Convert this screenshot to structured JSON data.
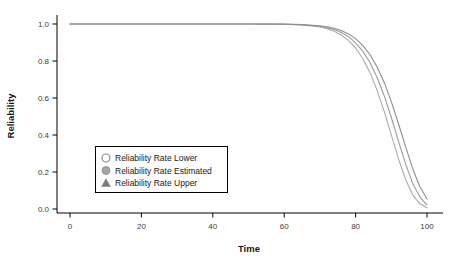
{
  "figure": {
    "background": "#ffffff"
  },
  "chart_data": {
    "type": "line",
    "title": "",
    "xlabel": "Time",
    "ylabel": "Reliability",
    "xlim": [
      0,
      100
    ],
    "ylim": [
      0.0,
      1.0
    ],
    "xticks": [
      "0",
      "20",
      "40",
      "60",
      "80",
      "100"
    ],
    "yticks": [
      "0.0",
      "0.2",
      "0.4",
      "0.6",
      "0.8",
      "1.0"
    ],
    "grid": false,
    "legend_position": "lower-left",
    "x": [
      0,
      10,
      20,
      30,
      40,
      50,
      55,
      60,
      65,
      70,
      72,
      74,
      76,
      78,
      80,
      82,
      84,
      86,
      88,
      90,
      92,
      94,
      96,
      98,
      100
    ],
    "series": [
      {
        "name": "Reliability Rate Lower",
        "marker": "open-circle",
        "color": "#ababab",
        "values": [
          1,
          1,
          1,
          1,
          1,
          0.9999,
          0.9997,
          0.9986,
          0.995,
          0.9837,
          0.9746,
          0.9609,
          0.9406,
          0.9114,
          0.8702,
          0.8135,
          0.7382,
          0.6426,
          0.5277,
          0.4004,
          0.2722,
          0.1596,
          0.0765,
          0.028,
          0.0072
        ]
      },
      {
        "name": "Reliability Rate Estimated",
        "marker": "filled-circle",
        "color": "#9c9c9c",
        "values": [
          1,
          1,
          1,
          1,
          1,
          0.9999,
          0.9997,
          0.9989,
          0.9962,
          0.9875,
          0.9804,
          0.9698,
          0.9541,
          0.9312,
          0.8986,
          0.8533,
          0.7919,
          0.7118,
          0.6122,
          0.4948,
          0.3679,
          0.244,
          0.1386,
          0.0641,
          0.0225
        ]
      },
      {
        "name": "Reliability Rate Upper",
        "marker": "filled-triangle",
        "color": "#8f8f8f",
        "values": [
          1,
          1,
          1,
          1,
          1,
          1,
          0.9998,
          0.9992,
          0.997,
          0.9903,
          0.9848,
          0.9766,
          0.9644,
          0.9465,
          0.9209,
          0.8847,
          0.8352,
          0.7692,
          0.6845,
          0.5808,
          0.462,
          0.3366,
          0.2177,
          0.1199,
          0.0534
        ]
      }
    ]
  },
  "colors": {
    "axis": "#000000",
    "tick_label": "#3d3d3d",
    "legend_border": "#000000",
    "legend_background": "#ffffff",
    "marker_open_stroke": "#8c8c8c",
    "marker_filled_circle": "#a6a6a6",
    "marker_triangle": "#7d7d7d"
  }
}
